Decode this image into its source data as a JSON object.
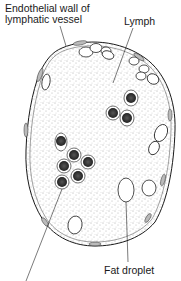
{
  "diagram": {
    "labels": {
      "endothelial_wall_line1": "Endothelial wall of",
      "endothelial_wall_line2": "lymphatic vessel",
      "lymph": "Lymph",
      "fat_droplet": "Fat droplet"
    },
    "colors": {
      "ink": "#1a1a1a",
      "background": "#ffffff",
      "stipple": "#555555",
      "cell_nucleus": "#2a2a2a"
    }
  }
}
